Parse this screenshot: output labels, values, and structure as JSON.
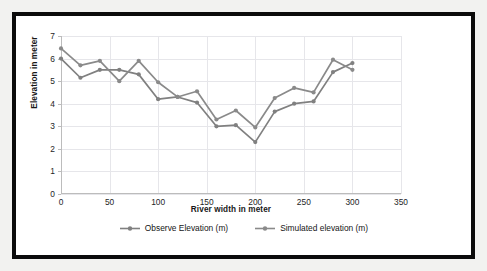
{
  "chart_data": {
    "type": "line",
    "title": "",
    "xlabel": "River width in meter",
    "ylabel": "Elevation in meter",
    "xlim": [
      0,
      350
    ],
    "ylim": [
      0,
      7
    ],
    "xticks": [
      0,
      50,
      100,
      150,
      200,
      250,
      300,
      350
    ],
    "yticks": [
      0,
      1,
      2,
      3,
      4,
      5,
      6,
      7
    ],
    "grid": true,
    "legend_position": "bottom",
    "x": [
      0,
      20,
      40,
      60,
      80,
      100,
      120,
      140,
      160,
      180,
      200,
      220,
      240,
      260,
      280,
      300
    ],
    "series": [
      {
        "name": "Observe Elevation (m)",
        "color": "#808080",
        "values": [
          6.0,
          5.15,
          5.5,
          5.5,
          5.3,
          4.2,
          4.3,
          4.05,
          3.0,
          3.05,
          2.3,
          3.65,
          4.0,
          4.1,
          5.4,
          5.8
        ]
      },
      {
        "name": "Simulated elevation (m)",
        "color": "#8a8a8a",
        "values": [
          6.45,
          5.7,
          5.9,
          5.0,
          5.9,
          4.95,
          4.3,
          4.55,
          3.3,
          3.7,
          2.95,
          4.25,
          4.7,
          4.5,
          5.95,
          5.5
        ]
      }
    ]
  },
  "legend": {
    "entries": [
      {
        "label": "Observe Elevation (m)",
        "icon": "line-marker-icon"
      },
      {
        "label": "Simulated elevation (m)",
        "icon": "line-marker-icon"
      }
    ]
  },
  "colors": {
    "frame": "#0b0b0b",
    "plot_background": "#ffffff",
    "page_background": "#f2f2f0",
    "gridline": "#e6e6ea",
    "axis_line": "#bcbcbc",
    "series_gray": "#808080",
    "text": "#171717"
  }
}
